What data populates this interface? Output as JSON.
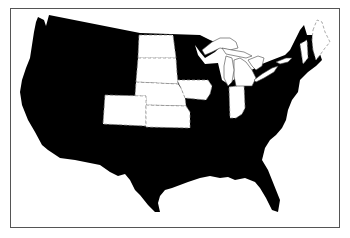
{
  "map": {
    "type": "choropleth-binary",
    "region": "United States (contiguous)",
    "colors": {
      "shaded": "#000000",
      "highlighted": "#ffffff",
      "frame_border": "#555555",
      "state_border_dashed": "#888888"
    },
    "highlighted_states": [
      "North Dakota",
      "South Dakota",
      "Nebraska",
      "Kansas",
      "Colorado",
      "Iowa",
      "Indiana",
      "Vermont",
      "Maine"
    ],
    "shaded_states": "all other contiguous states",
    "features": [
      "Great Lakes outlined in white"
    ]
  }
}
